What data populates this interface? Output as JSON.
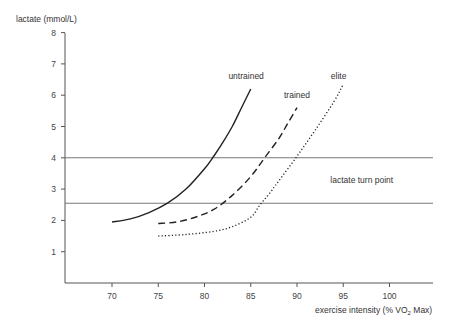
{
  "chart_data": {
    "type": "line",
    "title": "",
    "xlabel": "exercise intensity (% VO2 Max)",
    "xlabel_main": "exercise intensity (% VO",
    "xlabel_sub": "2",
    "xlabel_tail": " Max)",
    "ylabel": "lactate (mmol/L)",
    "xlim": [
      64,
      104.5
    ],
    "ylim": [
      0,
      8
    ],
    "x_ticks": [
      70,
      75,
      80,
      85,
      90,
      95,
      100
    ],
    "y_ticks": [
      1,
      2,
      3,
      4,
      5,
      6,
      7,
      8
    ],
    "grid": false,
    "legend": "inline labels",
    "series": [
      {
        "name": "untrained",
        "style": "solid",
        "x": [
          70,
          72,
          74,
          76,
          78,
          80,
          81,
          82,
          83,
          84,
          85
        ],
        "y": [
          1.95,
          2.05,
          2.25,
          2.55,
          3.0,
          3.65,
          4.05,
          4.5,
          5.0,
          5.6,
          6.2
        ]
      },
      {
        "name": "trained",
        "style": "dashed",
        "x": [
          75,
          77,
          79,
          81,
          83,
          85,
          86.5,
          88,
          89,
          90
        ],
        "y": [
          1.9,
          1.95,
          2.1,
          2.35,
          2.8,
          3.4,
          4.0,
          4.6,
          5.1,
          5.6
        ]
      },
      {
        "name": "elite",
        "style": "dotted",
        "x": [
          75,
          78,
          81,
          83,
          85,
          86,
          87,
          88,
          90,
          92,
          94,
          95
        ],
        "y": [
          1.5,
          1.55,
          1.65,
          1.8,
          2.1,
          2.5,
          2.85,
          3.25,
          4.05,
          4.9,
          5.8,
          6.35
        ]
      }
    ],
    "reference_lines": [
      {
        "axis": "y",
        "value": 4.0
      },
      {
        "axis": "y",
        "value": 2.55
      }
    ],
    "annotations": [
      {
        "text": "untrained",
        "x": 84.5,
        "y": 6.6
      },
      {
        "text": "trained",
        "x": 90,
        "y": 6.0
      },
      {
        "text": "elite",
        "x": 94.5,
        "y": 6.6
      },
      {
        "text": "lactate turn point",
        "x": 97,
        "y": 3.3
      }
    ]
  }
}
